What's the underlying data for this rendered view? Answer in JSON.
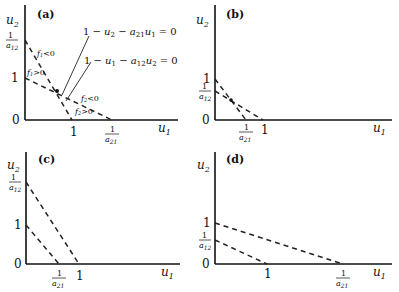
{
  "panels": [
    {
      "id": "a",
      "label": "(a)",
      "y_axis_label": "u2",
      "x_axis_label": "u1",
      "y_ticks": [
        "1/a12",
        "1",
        "0"
      ],
      "x_ticks": [
        "1",
        "1/a21"
      ],
      "annotations": {
        "nullcline_2": "1 − u2 − a21u1 = 0",
        "nullcline_1": "1 − u1 − a12u2 = 0",
        "f1_neg": "f1<0",
        "f1_pos": "f1>0",
        "f2_neg": "f2<0",
        "f2_pos": "f2>0"
      }
    },
    {
      "id": "b",
      "label": "(b)",
      "y_axis_label": "u2",
      "x_axis_label": "u1",
      "y_ticks": [
        "1",
        "1/a12",
        "0"
      ],
      "x_ticks": [
        "1/a21",
        "1"
      ]
    },
    {
      "id": "c",
      "label": "(c)",
      "y_axis_label": "u2",
      "x_axis_label": "u1",
      "y_ticks": [
        "1/a12",
        "1",
        "0"
      ],
      "x_ticks": [
        "1/a21",
        "1"
      ]
    },
    {
      "id": "d",
      "label": "(d)",
      "y_axis_label": "u2",
      "x_axis_label": "u1",
      "y_ticks": [
        "1",
        "1/a12",
        "0"
      ],
      "x_ticks": [
        "1",
        "1/a21"
      ]
    }
  ]
}
